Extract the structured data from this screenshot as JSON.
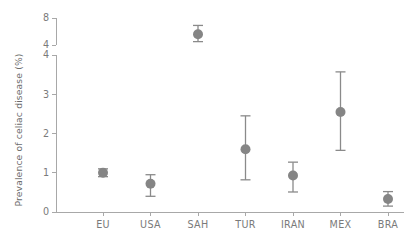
{
  "chart_data": {
    "type": "scatter",
    "title": "",
    "subtitle": "",
    "xlabel": "",
    "ylabel": "Prevalence of celiac disease (%)",
    "grid": false,
    "legend": null,
    "broken_axis": true,
    "axis_segments": [
      {
        "name": "lower",
        "ylim": [
          0,
          4
        ],
        "ticks": [
          0,
          1,
          2,
          3,
          4
        ],
        "tick_labels": [
          "0",
          "1",
          "2",
          "3",
          "4"
        ]
      },
      {
        "name": "upper",
        "ylim": [
          4,
          8
        ],
        "ticks": [
          4,
          8
        ],
        "tick_labels": [
          "4",
          "8"
        ]
      }
    ],
    "categories": [
      "EU",
      "USA",
      "SAH",
      "TUR",
      "IRAN",
      "MEX",
      "BRA"
    ],
    "values": [
      1.0,
      0.72,
      5.6,
      1.6,
      0.93,
      2.55,
      0.33
    ],
    "error_low": [
      0.9,
      0.4,
      4.5,
      0.82,
      0.51,
      1.57,
      0.15
    ],
    "error_high": [
      1.1,
      0.95,
      6.9,
      2.45,
      1.27,
      3.57,
      0.52
    ],
    "points": [
      {
        "category": "EU",
        "value": 1.0,
        "ci_low": 0.9,
        "ci_high": 1.1,
        "segment": "lower"
      },
      {
        "category": "USA",
        "value": 0.72,
        "ci_low": 0.4,
        "ci_high": 0.95,
        "segment": "lower"
      },
      {
        "category": "SAH",
        "value": 5.6,
        "ci_low": 4.5,
        "ci_high": 6.9,
        "segment": "upper"
      },
      {
        "category": "TUR",
        "value": 1.6,
        "ci_low": 0.82,
        "ci_high": 2.45,
        "segment": "lower"
      },
      {
        "category": "IRAN",
        "value": 0.93,
        "ci_low": 0.51,
        "ci_high": 1.27,
        "segment": "lower"
      },
      {
        "category": "MEX",
        "value": 2.55,
        "ci_low": 1.57,
        "ci_high": 3.57,
        "segment": "lower"
      },
      {
        "category": "BRA",
        "value": 0.33,
        "ci_low": 0.15,
        "ci_high": 0.52,
        "segment": "lower"
      }
    ],
    "colors": {
      "marker": "#858585",
      "error_bar": "#8a8a8a",
      "axis": "#a8a8a8",
      "text": "#7a7a7a",
      "background": "#ffffff"
    }
  }
}
